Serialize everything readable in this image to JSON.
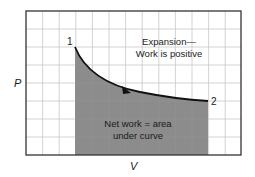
{
  "diagram": {
    "title": "",
    "axes": {
      "x_label": "V",
      "y_label": "P"
    },
    "points": [
      {
        "id": "1",
        "label": "1"
      },
      {
        "id": "2",
        "label": "2"
      }
    ],
    "process_annotation": {
      "line1": "Expansion—",
      "line2": "Work is positive"
    },
    "area_annotation": {
      "line1": "Net work = area",
      "line2": "under curve"
    },
    "colors": {
      "shaded_area": "#8c8c8c",
      "curve": "#111111",
      "grid": "#c8c8c8",
      "frame": "#333333"
    }
  }
}
